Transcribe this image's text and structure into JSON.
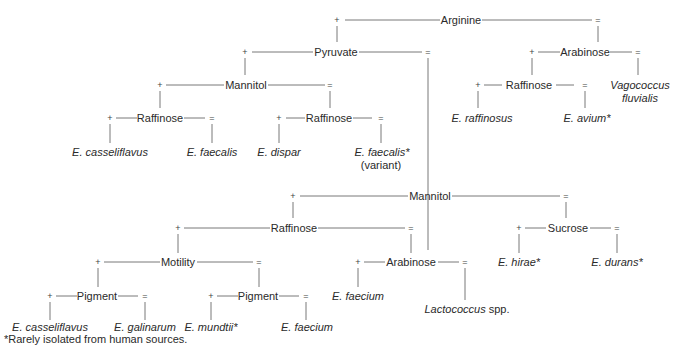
{
  "diagram": {
    "type": "identification-flowchart",
    "nodes": {
      "arginine": "Arginine",
      "pyruvate": "Pyruvate",
      "arabinose_top": "Arabinose",
      "mannitol_1": "Mannitol",
      "raffinose_1a": "Raffinose",
      "raffinose_1b": "Raffinose",
      "raffinose_top_right": "Raffinose",
      "mannitol_2": "Mannitol",
      "raffinose_2": "Raffinose",
      "sucrose": "Sucrose",
      "motility": "Motility",
      "arabinose_2": "Arabinose",
      "pigment_a": "Pigment",
      "pigment_b": "Pigment"
    },
    "leaves": {
      "e_raffinosus": "E. raffinosus",
      "e_avium": "E. avium*",
      "vagococcus_1": "Vagococcus",
      "vagococcus_2": "fluvialis",
      "e_casseliflavus_1": "E. casseliflavus",
      "e_faecalis": "E. faecalis",
      "e_dispar": "E. dispar",
      "e_faecalis_var": "E. faecalis*",
      "variant": "(variant)",
      "e_hirae": "E. hirae*",
      "e_durans": "E. durans*",
      "e_faecium_1": "E. faecium",
      "lactococcus": "Lactococcus",
      "lactococcus_spp": " spp.",
      "e_casseliflavus_2": "E. casseliflavus",
      "e_galinarum": "E. galinarum",
      "e_mundtii": "E. mundtii*",
      "e_faecium_2": "E. faecium"
    },
    "symbols": {
      "positive": "+",
      "negative": "="
    },
    "footnote": "*Rarely isolated from human sources."
  }
}
